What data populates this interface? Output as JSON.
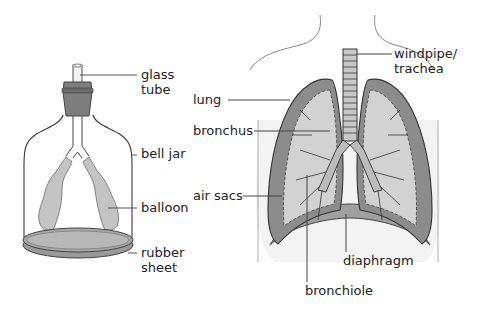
{
  "colors": {
    "line": "#3a3a3a",
    "lung_fill": "#8f8f8f",
    "lung_light": "#d0d0d0",
    "stopper": "#7a7a7a",
    "balloon": "#c8c8c8",
    "sheet": "#9a9a9a",
    "body_fill": "#f4f4f4"
  },
  "bell_jar_model": {
    "labels": {
      "glass_tube_1": "glass",
      "glass_tube_2": "tube",
      "bell_jar": "bell jar",
      "balloon": "balloon",
      "rubber_sheet_1": "rubber",
      "rubber_sheet_2": "sheet"
    }
  },
  "human_lungs": {
    "labels": {
      "windpipe_1": "windpipe/",
      "windpipe_2": "trachea",
      "lung": "lung",
      "bronchus": "bronchus",
      "air_sacs": "air sacs",
      "diaphragm": "diaphragm",
      "bronchiole": "bronchiole"
    }
  }
}
